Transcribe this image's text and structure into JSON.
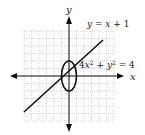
{
  "chart_data": {
    "type": "line",
    "title": "",
    "xlabel": "x",
    "ylabel": "y",
    "xlim": [
      -6,
      6
    ],
    "ylim": [
      -6,
      6
    ],
    "grid": true,
    "series": [
      {
        "name": "y = x + 1",
        "kind": "line",
        "equation": "y = x + 1",
        "x": [
          -6,
          5
        ],
        "y": [
          -5,
          6
        ]
      },
      {
        "name": "4x^2 + y^2 = 4",
        "kind": "ellipse",
        "equation": "4x² + y² = 4",
        "center": [
          0,
          0
        ],
        "semi_axis_x": 1,
        "semi_axis_y": 2
      }
    ],
    "annotations": [
      {
        "text": "y = x + 1",
        "near": "line upper right"
      },
      {
        "text": "4x² + y² = 4",
        "near": "ellipse right"
      }
    ]
  },
  "labels": {
    "x_axis": "x",
    "y_axis": "y",
    "line_eq_lhs": "y = x + 1",
    "ellipse_eq_a": "4x",
    "ellipse_eq_b": " + y",
    "ellipse_eq_c": " = 4",
    "sup": "2"
  },
  "colors": {
    "grid": "#b8b8b8",
    "axis": "#111111",
    "curve": "#111111"
  }
}
